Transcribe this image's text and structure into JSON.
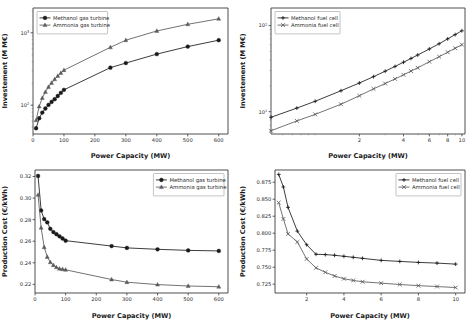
{
  "figure": {
    "background": "#ffffff",
    "series_colors": {
      "methanol": "#1a1a1a",
      "ammonia": "#5a5a5a"
    }
  },
  "panels": {
    "top_left": {
      "xlabel": "Power Capacity (MW)",
      "ylabel": "Investement (M M€)",
      "xticks": [
        "0",
        "100",
        "200",
        "300",
        "400",
        "500",
        "600"
      ],
      "yticks": [
        "10²",
        "10³"
      ],
      "legend": [
        "Methanol gas turbine",
        "Ammonia gas turbine"
      ]
    },
    "top_right": {
      "xlabel": "Power Capacity (MW)",
      "ylabel": "Investement (M M€)",
      "xticks": [
        "2",
        "4",
        "6",
        "8",
        "10"
      ],
      "yticks": [
        "10¹",
        "10²"
      ],
      "legend": [
        "Methanol fuel cell",
        "Ammonia fuel cell"
      ]
    },
    "bottom_left": {
      "xlabel": "Power Capacity (MW)",
      "ylabel": "Production Cost (€/kWh)",
      "xticks": [
        "0",
        "100",
        "200",
        "300",
        "400",
        "500",
        "600"
      ],
      "yticks": [
        "0.22",
        "0.24",
        "0.26",
        "0.28",
        "0.30",
        "0.32"
      ],
      "legend": [
        "Methanol gas turbine",
        "Ammonia gas turbine"
      ]
    },
    "bottom_right": {
      "xlabel": "Power Capacity (MW)",
      "ylabel": "Production Cost (€/kWh)",
      "xticks": [
        "2",
        "4",
        "6",
        "8",
        "10"
      ],
      "yticks": [
        "0.725",
        "0.750",
        "0.775",
        "0.800",
        "0.825",
        "0.850",
        "0.875"
      ],
      "legend": [
        "Methanol fuel cell",
        "Ammonia fuel cell"
      ]
    }
  },
  "chart_data": [
    {
      "type": "line",
      "panel": "top_left",
      "title": "",
      "xlabel": "Power Capacity (MW)",
      "ylabel": "Investement (M M€)",
      "xscale": "linear",
      "yscale": "log",
      "xlim": [
        0,
        630
      ],
      "ylim": [
        40,
        2200
      ],
      "xticks": [
        0,
        100,
        200,
        300,
        400,
        500,
        600
      ],
      "yticks": [
        100,
        1000
      ],
      "grid": false,
      "legend_position": "upper left",
      "series": [
        {
          "name": "Methanol gas turbine",
          "marker": "circle",
          "color": "#1a1a1a",
          "x": [
            10,
            20,
            30,
            40,
            50,
            60,
            70,
            80,
            90,
            100,
            250,
            300,
            400,
            500,
            600
          ],
          "y": [
            48,
            66,
            79,
            90,
            101,
            111,
            121,
            134,
            148,
            163,
            330,
            382,
            508,
            645,
            790
          ]
        },
        {
          "name": "Ammonia gas turbine",
          "marker": "triangle",
          "color": "#5a5a5a",
          "x": [
            10,
            20,
            30,
            40,
            50,
            60,
            70,
            80,
            90,
            100,
            250,
            300,
            400,
            500,
            600
          ],
          "y": [
            62,
            96,
            126,
            152,
            178,
            203,
            228,
            253,
            278,
            305,
            630,
            790,
            1060,
            1310,
            1560
          ]
        }
      ]
    },
    {
      "type": "line",
      "panel": "top_right",
      "title": "",
      "xlabel": "Power Capacity (MW)",
      "ylabel": "Investement (M M€)",
      "xscale": "log",
      "yscale": "log",
      "xlim": [
        0.5,
        10.5
      ],
      "ylim": [
        5.5,
        160
      ],
      "xticks": [
        2,
        4,
        6,
        8,
        10
      ],
      "yticks": [
        10,
        100
      ],
      "grid": false,
      "legend_position": "upper left",
      "series": [
        {
          "name": "Methanol fuel cell",
          "marker": "plus",
          "color": "#1a1a1a",
          "x": [
            0.5,
            0.75,
            1.0,
            1.5,
            2.0,
            2.5,
            3.0,
            3.5,
            4.0,
            4.5,
            5.0,
            6.0,
            7.0,
            8.0,
            9.0,
            10.0
          ],
          "y": [
            8.6,
            11.0,
            13.2,
            17.5,
            21.5,
            25.5,
            29.5,
            33.5,
            37.5,
            41.5,
            45.5,
            53.5,
            61.5,
            70.0,
            78.5,
            87.0
          ]
        },
        {
          "name": "Ammonia fuel cell",
          "marker": "x",
          "color": "#5a5a5a",
          "x": [
            0.5,
            0.75,
            1.0,
            1.5,
            2.0,
            2.5,
            3.0,
            3.5,
            4.0,
            4.5,
            5.0,
            6.0,
            7.0,
            8.0,
            9.0,
            10.0
          ],
          "y": [
            6.0,
            7.8,
            9.3,
            12.2,
            15.3,
            18.4,
            21.2,
            24.0,
            26.8,
            29.6,
            32.3,
            38.0,
            43.5,
            49.0,
            54.5,
            60.0
          ]
        }
      ]
    },
    {
      "type": "line",
      "panel": "bottom_left",
      "title": "",
      "xlabel": "Power Capacity (MW)",
      "ylabel": "Production Cost (€/kWh)",
      "xscale": "linear",
      "yscale": "linear",
      "xlim": [
        0,
        630
      ],
      "ylim": [
        0.212,
        0.326
      ],
      "xticks": [
        0,
        100,
        200,
        300,
        400,
        500,
        600
      ],
      "yticks": [
        0.22,
        0.24,
        0.26,
        0.28,
        0.3,
        0.32
      ],
      "grid": false,
      "legend_position": "upper right",
      "series": [
        {
          "name": "Methanol gas turbine",
          "marker": "circle",
          "color": "#1a1a1a",
          "x": [
            10,
            20,
            30,
            40,
            50,
            60,
            70,
            80,
            90,
            100,
            250,
            300,
            400,
            500,
            600
          ],
          "y": [
            0.3205,
            0.2885,
            0.2805,
            0.2775,
            0.2715,
            0.2685,
            0.2665,
            0.2645,
            0.2625,
            0.2605,
            0.2555,
            0.2538,
            0.2525,
            0.2515,
            0.251
          ]
        },
        {
          "name": "Ammonia gas turbine",
          "marker": "triangle",
          "color": "#5a5a5a",
          "x": [
            10,
            20,
            30,
            40,
            50,
            60,
            70,
            80,
            90,
            100,
            250,
            300,
            400,
            500,
            600
          ],
          "y": [
            0.303,
            0.2725,
            0.2545,
            0.2455,
            0.2405,
            0.2378,
            0.2358,
            0.2345,
            0.234,
            0.2335,
            0.2245,
            0.222,
            0.2198,
            0.2185,
            0.2178
          ]
        }
      ]
    },
    {
      "type": "line",
      "panel": "bottom_right",
      "title": "",
      "xlabel": "Power Capacity (MW)",
      "ylabel": "Production Cost (€/kWh)",
      "xscale": "linear",
      "yscale": "linear",
      "xlim": [
        0.3,
        10.5
      ],
      "ylim": [
        0.712,
        0.893
      ],
      "xticks": [
        2,
        4,
        6,
        8,
        10
      ],
      "yticks": [
        0.725,
        0.75,
        0.775,
        0.8,
        0.825,
        0.85,
        0.875
      ],
      "grid": false,
      "legend_position": "upper right",
      "series": [
        {
          "name": "Methanol fuel cell",
          "marker": "plus",
          "color": "#1a1a1a",
          "x": [
            0.5,
            0.75,
            1.0,
            1.5,
            2.0,
            2.5,
            3.0,
            3.5,
            4.0,
            4.5,
            5.0,
            6.0,
            7.0,
            8.0,
            9.0,
            10.0
          ],
          "y": [
            0.8865,
            0.868,
            0.838,
            0.803,
            0.783,
            0.769,
            0.7685,
            0.7675,
            0.766,
            0.7645,
            0.763,
            0.76,
            0.7585,
            0.757,
            0.756,
            0.7545
          ]
        },
        {
          "name": "Ammonia fuel cell",
          "marker": "x",
          "color": "#5a5a5a",
          "x": [
            0.5,
            0.75,
            1.0,
            1.5,
            2.0,
            2.5,
            3.0,
            3.5,
            4.0,
            4.5,
            5.0,
            6.0,
            7.0,
            8.0,
            9.0,
            10.0
          ],
          "y": [
            0.845,
            0.821,
            0.799,
            0.787,
            0.762,
            0.749,
            0.7425,
            0.737,
            0.733,
            0.7305,
            0.7285,
            0.7265,
            0.7245,
            0.7228,
            0.7215,
            0.72
          ]
        }
      ]
    }
  ]
}
